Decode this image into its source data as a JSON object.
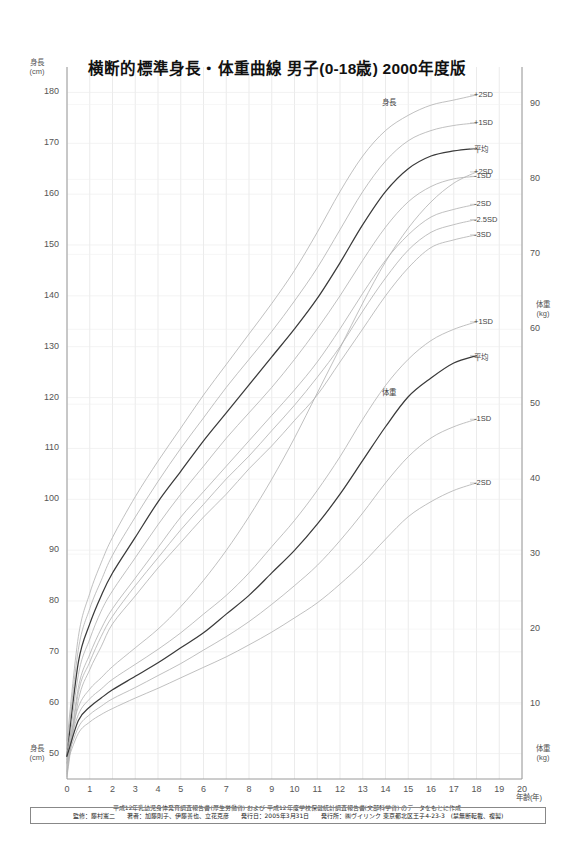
{
  "title": "横断的標準身長・体重曲線 男子(0-18歳) 2000年度版",
  "axes": {
    "left_caption_top": "身長\n(cm)",
    "left_caption_top_l1": "身長",
    "left_caption_top_l2": "(cm)",
    "left_caption_bottom_l1": "身長",
    "left_caption_bottom_l2": "(cm)",
    "right_caption_top_l1": "体重",
    "right_caption_top_l2": "(kg)",
    "right_caption_bottom_l1": "体重",
    "right_caption_bottom_l2": "(kg)",
    "x_caption": "年齢(年)"
  },
  "series_titles": {
    "height": "身長",
    "weight": "体重"
  },
  "footer": {
    "source": "平成12年乳幼児身体発育調査報告書(厚生労働省) および 平成12年度学校保健統計調査報告書(文部科学省) のデータをもとに作成",
    "credit": "監修：藤村憲二　　著者：加藤則子、伊藤善也、立花克彦　　発行日：2005年3月31日　　発行所：㈱ヴイリンク 東京都北区王子4-23-3　(禁無断転載、複製)"
  },
  "chart_data": {
    "type": "line",
    "title": "横断的標準身長・体重曲線 男子(0-18歳) 2000年度版",
    "xlabel": "年齢(年)",
    "ylabel": "身長 (cm)",
    "ylabel_right": "体重 (kg)",
    "xlim": [
      0,
      20
    ],
    "ylim": [
      45,
      185
    ],
    "ylim_right": [
      0,
      95
    ],
    "grid": true,
    "legend": "inline-right",
    "x_ticks": [
      0,
      1,
      2,
      3,
      4,
      5,
      6,
      7,
      8,
      9,
      10,
      11,
      12,
      13,
      14,
      15,
      16,
      17,
      18,
      19,
      20
    ],
    "y_ticks_left": [
      50,
      60,
      70,
      80,
      90,
      100,
      110,
      120,
      130,
      140,
      150,
      160,
      170,
      180
    ],
    "y_ticks_right": [
      10,
      20,
      30,
      40,
      50,
      60,
      70,
      80,
      90
    ],
    "x": [
      0,
      0.5,
      1,
      1.5,
      2,
      3,
      4,
      5,
      6,
      7,
      8,
      9,
      10,
      11,
      12,
      13,
      14,
      15,
      16,
      17,
      18
    ],
    "height_series": [
      {
        "name": "+2SD",
        "label": "+2SD",
        "unit": "cm",
        "values": [
          52.5,
          73.0,
          81.5,
          87.5,
          92.5,
          100.5,
          107.5,
          114.0,
          120.5,
          126.5,
          132.5,
          138.5,
          145.0,
          152.5,
          160.5,
          167.5,
          172.5,
          175.5,
          177.5,
          178.5,
          179.5
        ]
      },
      {
        "name": "+1SD",
        "label": "+1SD",
        "unit": "cm",
        "values": [
          51.0,
          70.5,
          78.5,
          84.0,
          89.0,
          96.5,
          103.5,
          110.0,
          116.0,
          122.0,
          127.5,
          133.0,
          139.0,
          145.5,
          153.0,
          160.5,
          166.5,
          170.5,
          172.5,
          173.5,
          174.0
        ]
      },
      {
        "name": "平均",
        "label": "平均",
        "unit": "cm",
        "values": [
          49.5,
          68.0,
          75.5,
          81.0,
          85.5,
          92.5,
          99.5,
          105.5,
          111.5,
          117.0,
          122.5,
          128.0,
          133.5,
          139.5,
          146.5,
          154.0,
          160.5,
          165.0,
          167.5,
          168.5,
          169.0
        ]
      },
      {
        "name": "-1SD",
        "label": "-1SD",
        "unit": "cm",
        "values": [
          48.0,
          65.5,
          72.5,
          78.0,
          82.0,
          88.5,
          95.0,
          101.0,
          106.5,
          112.0,
          117.0,
          122.0,
          127.5,
          133.5,
          140.0,
          147.0,
          153.5,
          158.5,
          161.5,
          163.0,
          163.5
        ]
      },
      {
        "name": "-2SD",
        "label": "-2SD",
        "unit": "cm",
        "values": [
          46.5,
          63.0,
          69.5,
          74.5,
          78.5,
          84.5,
          90.5,
          96.5,
          101.5,
          106.5,
          111.5,
          116.5,
          121.5,
          127.0,
          133.5,
          140.5,
          147.0,
          152.0,
          155.5,
          157.0,
          158.0
        ]
      },
      {
        "name": "-2.5SD",
        "label": "-2.5SD",
        "unit": "cm",
        "values": [
          46.0,
          62.0,
          68.0,
          73.0,
          77.0,
          83.0,
          88.5,
          94.0,
          99.0,
          104.0,
          108.5,
          113.5,
          118.5,
          124.0,
          130.0,
          137.0,
          143.5,
          149.0,
          152.5,
          154.0,
          155.0
        ]
      },
      {
        "name": "-3SD",
        "label": "-3SD",
        "unit": "cm",
        "values": [
          45.5,
          60.5,
          66.5,
          71.0,
          75.5,
          81.0,
          86.5,
          91.5,
          96.5,
          101.0,
          106.0,
          110.5,
          115.5,
          120.5,
          127.0,
          133.5,
          140.0,
          145.5,
          149.5,
          151.0,
          152.0
        ]
      }
    ],
    "weight_series": [
      {
        "name": "+2SD",
        "label": "+2SD",
        "unit": "kg",
        "values": [
          4.0,
          9.6,
          12.0,
          13.5,
          15.0,
          17.5,
          20.0,
          23.0,
          26.5,
          30.5,
          35.0,
          40.0,
          45.5,
          51.5,
          57.5,
          63.5,
          69.0,
          73.5,
          77.0,
          79.5,
          81.0
        ]
      },
      {
        "name": "+1SD",
        "label": "+1SD",
        "unit": "kg",
        "values": [
          3.5,
          8.6,
          10.7,
          12.0,
          13.3,
          15.3,
          17.3,
          19.5,
          22.0,
          24.5,
          27.5,
          31.0,
          34.5,
          38.5,
          43.0,
          48.0,
          52.5,
          56.0,
          58.5,
          60.0,
          61.0
        ]
      },
      {
        "name": "平均",
        "label": "平均",
        "unit": "kg",
        "values": [
          3.0,
          7.8,
          9.6,
          10.8,
          11.9,
          13.7,
          15.5,
          17.5,
          19.5,
          22.0,
          24.5,
          27.5,
          30.5,
          34.0,
          38.0,
          42.5,
          47.0,
          51.0,
          53.5,
          55.5,
          56.5
        ]
      },
      {
        "name": "-1SD",
        "label": "-1SD",
        "unit": "kg",
        "values": [
          2.6,
          6.9,
          8.6,
          9.7,
          10.7,
          12.2,
          13.8,
          15.4,
          17.2,
          19.0,
          21.0,
          23.3,
          25.8,
          28.5,
          31.8,
          35.5,
          39.5,
          43.0,
          45.5,
          47.0,
          48.0
        ]
      },
      {
        "name": "-2SD",
        "label": "-2SD",
        "unit": "kg",
        "values": [
          2.2,
          6.1,
          7.6,
          8.6,
          9.4,
          10.8,
          12.1,
          13.5,
          14.9,
          16.3,
          17.9,
          19.6,
          21.5,
          23.5,
          26.0,
          28.8,
          32.0,
          35.0,
          37.0,
          38.5,
          39.5
        ]
      }
    ]
  }
}
